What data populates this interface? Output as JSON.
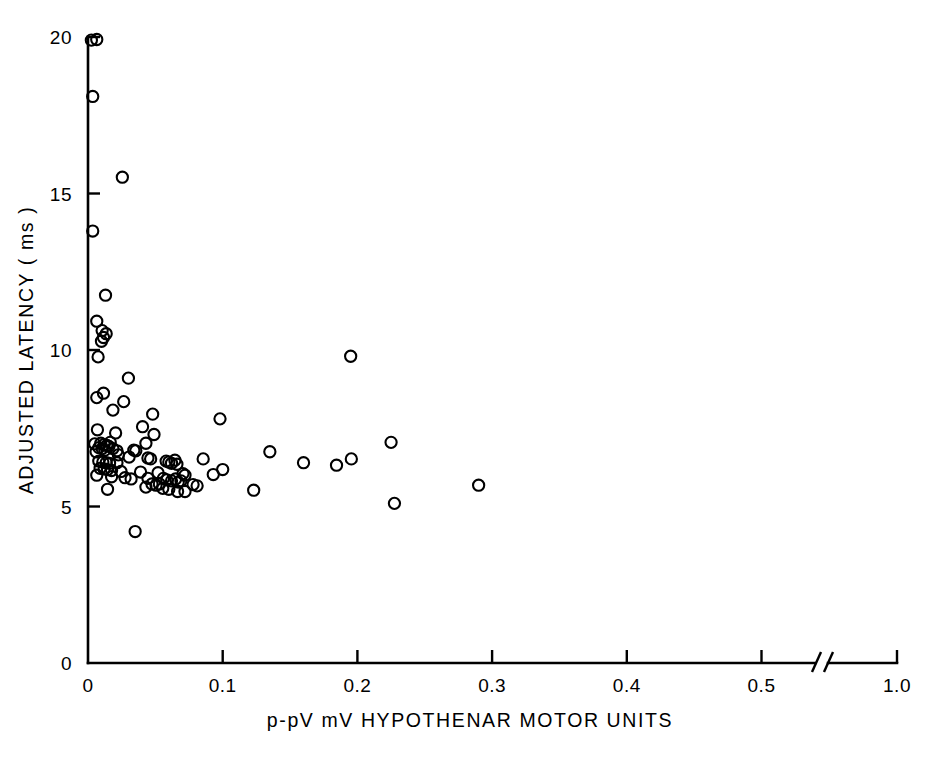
{
  "chart_data": {
    "type": "scatter",
    "title": "",
    "xlabel": "p-pV mV  HYPOTHENAR MOTOR UNITS",
    "ylabel": "ADJUSTED LATENCY ( ms )",
    "xlim": [
      0,
      0.55
    ],
    "ylim": [
      0,
      20
    ],
    "grid": false,
    "legend": null,
    "axis_break": {
      "present": true,
      "after_tick": "0.5",
      "resume_tick": "1.0",
      "style": "double-slash"
    },
    "xticks": [
      {
        "label": "0",
        "value": 0
      },
      {
        "label": "0.1",
        "value": 0.1
      },
      {
        "label": "0.2",
        "value": 0.2
      },
      {
        "label": "0.3",
        "value": 0.3
      },
      {
        "label": "0.4",
        "value": 0.4
      },
      {
        "label": "0.5",
        "value": 0.5
      },
      {
        "label": "1.0",
        "value": 1.0
      }
    ],
    "yticks": [
      {
        "label": "0",
        "value": 0
      },
      {
        "label": "5",
        "value": 5
      },
      {
        "label": "10",
        "value": 10
      },
      {
        "label": "15",
        "value": 15
      },
      {
        "label": "20",
        "value": 20
      }
    ],
    "marker": {
      "shape": "circle-open",
      "radius_px": 5.6,
      "color": "#000000"
    },
    "n_points": 96,
    "points": [
      [
        0.0025,
        19.9
      ],
      [
        0.0065,
        19.92
      ],
      [
        0.0035,
        18.1
      ],
      [
        0.0255,
        15.52
      ],
      [
        0.0035,
        13.8
      ],
      [
        0.013,
        11.75
      ],
      [
        0.0065,
        10.92
      ],
      [
        0.0105,
        10.62
      ],
      [
        0.0135,
        10.52
      ],
      [
        0.0115,
        10.4
      ],
      [
        0.01,
        10.28
      ],
      [
        0.0075,
        9.78
      ],
      [
        0.03,
        9.1
      ],
      [
        0.195,
        9.8
      ],
      [
        0.0115,
        8.62
      ],
      [
        0.0065,
        8.48
      ],
      [
        0.0265,
        8.35
      ],
      [
        0.0185,
        8.08
      ],
      [
        0.048,
        7.95
      ],
      [
        0.098,
        7.8
      ],
      [
        0.0405,
        7.55
      ],
      [
        0.007,
        7.45
      ],
      [
        0.0205,
        7.35
      ],
      [
        0.049,
        7.3
      ],
      [
        0.225,
        7.05
      ],
      [
        0.005,
        7.0
      ],
      [
        0.0095,
        7.02
      ],
      [
        0.012,
        6.98
      ],
      [
        0.014,
        6.95
      ],
      [
        0.0155,
        6.92
      ],
      [
        0.0165,
        7.05
      ],
      [
        0.008,
        6.88
      ],
      [
        0.0105,
        6.85
      ],
      [
        0.0185,
        6.85
      ],
      [
        0.0125,
        6.8
      ],
      [
        0.0215,
        6.78
      ],
      [
        0.006,
        6.75
      ],
      [
        0.034,
        6.8
      ],
      [
        0.0355,
        6.78
      ],
      [
        0.135,
        6.75
      ],
      [
        0.0305,
        6.58
      ],
      [
        0.0445,
        6.55
      ],
      [
        0.0465,
        6.52
      ],
      [
        0.0855,
        6.52
      ],
      [
        0.008,
        6.45
      ],
      [
        0.011,
        6.42
      ],
      [
        0.0135,
        6.4
      ],
      [
        0.016,
        6.38
      ],
      [
        0.0215,
        6.4
      ],
      [
        0.058,
        6.45
      ],
      [
        0.06,
        6.42
      ],
      [
        0.062,
        6.38
      ],
      [
        0.0645,
        6.48
      ],
      [
        0.066,
        6.35
      ],
      [
        0.1,
        6.18
      ],
      [
        0.16,
        6.4
      ],
      [
        0.1955,
        6.52
      ],
      [
        0.1845,
        6.32
      ],
      [
        0.009,
        6.22
      ],
      [
        0.012,
        6.2
      ],
      [
        0.0145,
        6.18
      ],
      [
        0.0175,
        6.15
      ],
      [
        0.0245,
        6.12
      ],
      [
        0.039,
        6.1
      ],
      [
        0.052,
        6.08
      ],
      [
        0.0705,
        6.05
      ],
      [
        0.072,
        6.0
      ],
      [
        0.093,
        6.02
      ],
      [
        0.0065,
        6.0
      ],
      [
        0.0175,
        5.95
      ],
      [
        0.0275,
        5.92
      ],
      [
        0.032,
        5.88
      ],
      [
        0.0445,
        5.9
      ],
      [
        0.056,
        5.9
      ],
      [
        0.0585,
        5.85
      ],
      [
        0.062,
        5.82
      ],
      [
        0.065,
        5.88
      ],
      [
        0.067,
        5.78
      ],
      [
        0.069,
        5.82
      ],
      [
        0.0475,
        5.72
      ],
      [
        0.0505,
        5.68
      ],
      [
        0.053,
        5.72
      ],
      [
        0.078,
        5.7
      ],
      [
        0.081,
        5.66
      ],
      [
        0.0555,
        5.58
      ],
      [
        0.06,
        5.55
      ],
      [
        0.123,
        5.52
      ],
      [
        0.043,
        5.62
      ],
      [
        0.0145,
        5.55
      ],
      [
        0.0665,
        5.48
      ],
      [
        0.072,
        5.48
      ],
      [
        0.2275,
        5.1
      ],
      [
        0.29,
        5.68
      ],
      [
        0.035,
        4.2
      ],
      [
        0.0225,
        6.65
      ],
      [
        0.043,
        7.02
      ]
    ]
  }
}
